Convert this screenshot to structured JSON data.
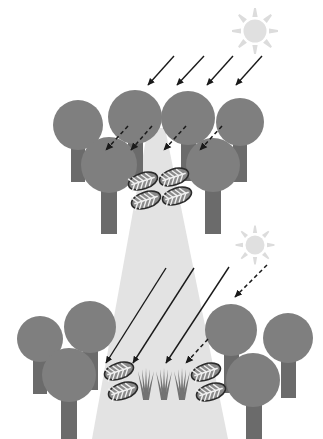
{
  "figure": {
    "width": 323,
    "height": 439,
    "background_color": "#ffffff"
  },
  "palette": {
    "canopy": "#7f7f7f",
    "canopy_edge": "#767676",
    "trunk": "#6b6b6b",
    "light_beam": "#e3e3e3",
    "light_beam_edge": "#dcdcdc",
    "sun": "#e0e0e0",
    "sun_ray": "#dcdcdc",
    "arrow": "#1a1a1a",
    "leaf_fill": "#8a8a8a",
    "leaf_outline": "#2b2b2b",
    "leaf_vein": "#f0f0f0",
    "grass": "#737373"
  },
  "suns": [
    {
      "name": "upper-sun",
      "label": "Sun (upper)",
      "cx": 255,
      "cy": 31,
      "r": 11.5,
      "ray_count": 8,
      "ray_inner": 14,
      "ray_outer": 23,
      "ray_width": 5.5
    },
    {
      "name": "lower-sun",
      "label": "Sun (lower)",
      "cx": 255,
      "cy": 245,
      "r": 9.5,
      "ray_count": 8,
      "ray_inner": 12,
      "ray_outer": 19.5,
      "ray_width": 4.5
    }
  ],
  "light_beam": {
    "name": "canopy-gap-light-beam",
    "label": "Light beam through canopy gap",
    "top_left_x": 148,
    "top_right_x": 165,
    "top_y": 128,
    "bottom_left_x": 92,
    "bottom_right_x": 228,
    "bottom_y": 439,
    "fill": "#e3e3e3"
  },
  "upper_canopy": {
    "label": "Upper closed-canopy tree layer",
    "trees": [
      {
        "name": "tree-u1",
        "cx": 78,
        "cy": 125,
        "r": 25,
        "trunk_x": 71,
        "trunk_y": 148,
        "trunk_w": 14,
        "trunk_h": 34
      },
      {
        "name": "tree-u2",
        "cx": 135,
        "cy": 117,
        "r": 27,
        "trunk_x": 128,
        "trunk_y": 140,
        "trunk_w": 15,
        "trunk_h": 40
      },
      {
        "name": "tree-u3",
        "cx": 188,
        "cy": 118,
        "r": 27,
        "trunk_x": 181,
        "trunk_y": 141,
        "trunk_w": 15,
        "trunk_h": 40
      },
      {
        "name": "tree-u4",
        "cx": 240,
        "cy": 122,
        "r": 24,
        "trunk_x": 233,
        "trunk_y": 144,
        "trunk_w": 14,
        "trunk_h": 38
      },
      {
        "name": "tree-u5",
        "cx": 109,
        "cy": 165,
        "r": 28,
        "trunk_x": 101,
        "trunk_y": 189,
        "trunk_w": 16,
        "trunk_h": 45
      },
      {
        "name": "tree-u6",
        "cx": 213,
        "cy": 165,
        "r": 27,
        "trunk_x": 205,
        "trunk_y": 189,
        "trunk_w": 16,
        "trunk_h": 45
      }
    ]
  },
  "lower_canopy": {
    "label": "Lower gap-edge tree layer",
    "trees": [
      {
        "name": "tree-l1",
        "cx": 40,
        "cy": 339,
        "r": 23,
        "trunk_x": 33,
        "trunk_y": 360,
        "trunk_w": 14,
        "trunk_h": 34
      },
      {
        "name": "tree-l2",
        "cx": 90,
        "cy": 327,
        "r": 26,
        "trunk_x": 83,
        "trunk_y": 350,
        "trunk_w": 15,
        "trunk_h": 40
      },
      {
        "name": "tree-l3",
        "cx": 69,
        "cy": 375,
        "r": 27,
        "trunk_x": 61,
        "trunk_y": 399,
        "trunk_w": 16,
        "trunk_h": 40
      },
      {
        "name": "tree-l4",
        "cx": 231,
        "cy": 330,
        "r": 26,
        "trunk_x": 224,
        "trunk_y": 353,
        "trunk_w": 15,
        "trunk_h": 40
      },
      {
        "name": "tree-l5",
        "cx": 288,
        "cy": 338,
        "r": 25,
        "trunk_x": 281,
        "trunk_y": 360,
        "trunk_w": 15,
        "trunk_h": 38
      },
      {
        "name": "tree-l6",
        "cx": 253,
        "cy": 380,
        "r": 27,
        "trunk_x": 246,
        "trunk_y": 404,
        "trunk_w": 16,
        "trunk_h": 35
      }
    ]
  },
  "solid_arrows_upper": {
    "label": "Direct sunlight rays onto upper canopy",
    "count": 4,
    "arrows": [
      {
        "name": "sun-ray-arrow-u1",
        "x1": 174,
        "y1": 56,
        "x2": 148,
        "y2": 85
      },
      {
        "name": "sun-ray-arrow-u2",
        "x1": 204,
        "y1": 56,
        "x2": 177,
        "y2": 85
      },
      {
        "name": "sun-ray-arrow-u3",
        "x1": 233,
        "y1": 56,
        "x2": 207,
        "y2": 85
      },
      {
        "name": "sun-ray-arrow-u4",
        "x1": 262,
        "y1": 56,
        "x2": 236,
        "y2": 85
      }
    ]
  },
  "dashed_arrows_upper": {
    "label": "Diffuse / filtered light under upper canopy",
    "count": 4,
    "arrows": [
      {
        "name": "diffuse-arrow-u1",
        "x1": 128,
        "y1": 126,
        "x2": 106,
        "y2": 150
      },
      {
        "name": "diffuse-arrow-u2",
        "x1": 152,
        "y1": 126,
        "x2": 131,
        "y2": 150
      },
      {
        "name": "diffuse-arrow-u3",
        "x1": 186,
        "y1": 126,
        "x2": 164,
        "y2": 150
      },
      {
        "name": "diffuse-arrow-u4",
        "x1": 222,
        "y1": 126,
        "x2": 200,
        "y2": 150
      }
    ]
  },
  "solid_arrows_lower": {
    "label": "Direct sunlight rays into canopy gap",
    "count": 3,
    "arrows": [
      {
        "name": "gap-ray-arrow-l1",
        "x1": 166,
        "y1": 268,
        "x2": 106,
        "y2": 363
      },
      {
        "name": "gap-ray-arrow-l2",
        "x1": 194,
        "y1": 268,
        "x2": 133,
        "y2": 363
      },
      {
        "name": "gap-ray-arrow-l3",
        "x1": 229,
        "y1": 267,
        "x2": 166,
        "y2": 363
      }
    ]
  },
  "dashed_arrows_lower": {
    "label": "Filtered light at gap edge",
    "count": 2,
    "arrows": [
      {
        "name": "sun-to-canopy-arrow-l",
        "x1": 267,
        "y1": 265,
        "x2": 235,
        "y2": 297
      },
      {
        "name": "diffuse-arrow-l1",
        "x1": 208,
        "y1": 339,
        "x2": 186,
        "y2": 363
      }
    ]
  },
  "leaves_upper": {
    "label": "Leaf litter under upper canopy gap",
    "count": 4,
    "items": [
      {
        "name": "leaf-u1",
        "cx": 143,
        "cy": 181,
        "rx": 15,
        "ry": 8,
        "rot": -18
      },
      {
        "name": "leaf-u2",
        "cx": 174,
        "cy": 177,
        "rx": 15,
        "ry": 8,
        "rot": -18
      },
      {
        "name": "leaf-u3",
        "cx": 146,
        "cy": 200,
        "rx": 15,
        "ry": 8,
        "rot": -18
      },
      {
        "name": "leaf-u4",
        "cx": 177,
        "cy": 196,
        "rx": 15,
        "ry": 8,
        "rot": -18
      }
    ]
  },
  "leaves_lower": {
    "label": "Leaf litter on gap floor",
    "count": 4,
    "items": [
      {
        "name": "leaf-l1",
        "cx": 119,
        "cy": 371,
        "rx": 15,
        "ry": 8,
        "rot": -18
      },
      {
        "name": "leaf-l2",
        "cx": 123,
        "cy": 391,
        "rx": 15,
        "ry": 8,
        "rot": -18
      },
      {
        "name": "leaf-l3",
        "cx": 206,
        "cy": 372,
        "rx": 15,
        "ry": 8,
        "rot": -18
      },
      {
        "name": "leaf-l4",
        "cx": 211,
        "cy": 392,
        "rx": 15,
        "ry": 8,
        "rot": -18
      }
    ]
  },
  "seedlings": {
    "label": "Seedlings / grass regenerating in the gap",
    "count": 3,
    "items": [
      {
        "name": "seedling-1",
        "cx": 146,
        "base_y": 400,
        "height": 32,
        "blades": 5,
        "spread": 8
      },
      {
        "name": "seedling-2",
        "cx": 164,
        "base_y": 400,
        "height": 32,
        "blades": 5,
        "spread": 8
      },
      {
        "name": "seedling-3",
        "cx": 182,
        "base_y": 400,
        "height": 32,
        "blades": 5,
        "spread": 8
      }
    ]
  }
}
